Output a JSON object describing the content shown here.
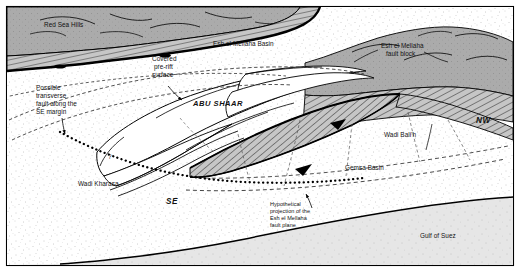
{
  "figure": {
    "kind": "geological-block-diagram",
    "title_visible": false,
    "border_color": "#000000",
    "background_color": "#ffffff"
  },
  "colors": {
    "basement_fill": "#a8a8a8",
    "hatch_fill": "#c9c9c9",
    "stipple_fill": "#f2f2f2",
    "sea_fill": "#e2e2e2",
    "white_surface": "#ffffff",
    "line": "#000000",
    "text": "#111111"
  },
  "labels": {
    "red_sea_hills": "Red Sea Hills",
    "esh_el_mellaha_basin": "Esh el Mellaha Basin",
    "esh_el_mellaha_fault_block_line1": "Esh el Mellaha",
    "esh_el_mellaha_fault_block_line2": "fault block",
    "covered_line1": "Covered",
    "covered_line2": "pre-rift",
    "covered_line3": "surface",
    "possible_fault_line1": "Possible",
    "possible_fault_line2": "transverse",
    "possible_fault_line3": "fault along the",
    "possible_fault_line4": "SE margin",
    "abu_shaar": "ABU SHAAR",
    "wadi_balih": "Wadi Bali'h",
    "wadi_kharasa": "Wadi Kharasa",
    "gemsa_basin": "Gemsa Basin",
    "gulf_of_suez": "Gulf of Suez",
    "hypothetical_line1": "Hypothetical",
    "hypothetical_line2": "projection of the",
    "hypothetical_line3": "Esh el Mellaha",
    "hypothetical_line4": "fault plane",
    "direction_nw": "NW",
    "direction_se": "SE",
    "query_marker": "?"
  },
  "map_features": [
    {
      "name": "Red Sea Hills",
      "type": "uplifted-basement-highland",
      "position": "upper-left"
    },
    {
      "name": "Esh el Mellaha Basin",
      "type": "basin",
      "position": "upper-center"
    },
    {
      "name": "Esh el Mellaha fault block",
      "type": "tilted-fault-block",
      "position": "upper-right"
    },
    {
      "name": "Abu Shaar",
      "type": "block-crest",
      "position": "center"
    },
    {
      "name": "Wadi Bali'h",
      "type": "wadi",
      "position": "center-right"
    },
    {
      "name": "Wadi Kharasa",
      "type": "wadi",
      "position": "lower-left"
    },
    {
      "name": "Gemsa Basin",
      "type": "basin",
      "position": "lower-right"
    },
    {
      "name": "Gulf of Suez",
      "type": "sea",
      "position": "bottom-right"
    }
  ],
  "annotations": [
    {
      "name": "covered-pre-rift-surface",
      "has_leader_arrow": true
    },
    {
      "name": "possible-transverse-fault",
      "has_leader_arrow": true
    },
    {
      "name": "hypothetical-fault-plane-projection",
      "has_leader_arrow": true
    }
  ],
  "orientation": {
    "nw": "NW",
    "se": "SE"
  }
}
